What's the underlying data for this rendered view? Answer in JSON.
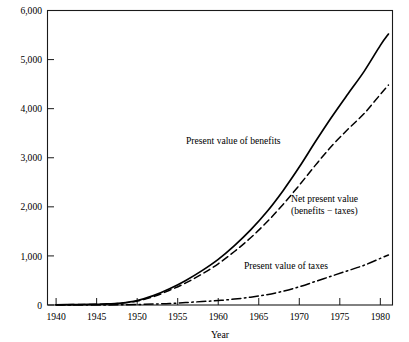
{
  "figure": {
    "units_caption": "(in 1982 dollars)"
  },
  "chart_data": {
    "type": "line",
    "title": "",
    "subtitle": "(in 1982 dollars)",
    "xlabel": "Year",
    "ylabel": "",
    "xlim": [
      1939,
      1981.5
    ],
    "ylim": [
      0,
      6000
    ],
    "grid": false,
    "legend_position": "inline-annotations",
    "xticks": [
      1940,
      1945,
      1950,
      1955,
      1960,
      1965,
      1970,
      1975,
      1980
    ],
    "xtick_labels": [
      "1940",
      "1945",
      "1950",
      "1955",
      "1960",
      "1965",
      "1970",
      "1975",
      "1980"
    ],
    "yticks": [
      0,
      1000,
      2000,
      3000,
      4000,
      5000,
      6000
    ],
    "ytick_labels": [
      "0",
      "1,000",
      "2,000",
      "3,000",
      "4,000",
      "5,000",
      "6,000"
    ],
    "x": [
      1940,
      1942,
      1944,
      1946,
      1948,
      1950,
      1952,
      1954,
      1956,
      1958,
      1960,
      1962,
      1964,
      1966,
      1968,
      1970,
      1972,
      1974,
      1976,
      1978,
      1980,
      1981
    ],
    "series": [
      {
        "name": "Present value of benefits",
        "style": "solid",
        "annotation": "Present value of benefits",
        "values": [
          5,
          8,
          12,
          20,
          40,
          90,
          190,
          330,
          500,
          700,
          930,
          1210,
          1530,
          1900,
          2330,
          2810,
          3330,
          3830,
          4300,
          4760,
          5290,
          5520
        ]
      },
      {
        "name": "Net present value (benefits − taxes)",
        "style": "dashed",
        "annotation_line1": "Net present value",
        "annotation_line2": "(benefits − taxes)",
        "values": [
          5,
          8,
          11,
          18,
          36,
          80,
          170,
          300,
          450,
          630,
          840,
          1090,
          1370,
          1690,
          2050,
          2440,
          2850,
          3240,
          3580,
          3900,
          4290,
          4480
        ]
      },
      {
        "name": "Present value of taxes",
        "style": "dashdot",
        "annotation": "Present value of taxes",
        "values": [
          0,
          0,
          1,
          2,
          4,
          10,
          20,
          30,
          50,
          70,
          90,
          120,
          160,
          210,
          280,
          370,
          480,
          590,
          700,
          810,
          950,
          1020
        ]
      }
    ],
    "colors": {
      "line": "#000000",
      "axis": "#1a1a1a",
      "background": "#ffffff"
    }
  }
}
